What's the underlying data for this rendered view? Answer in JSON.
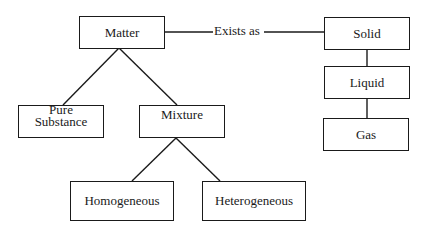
{
  "diagram": {
    "title": "",
    "nodes": {
      "matter": "Matter",
      "solid": "Solid",
      "liquid": "Liquid",
      "gas": "Gas",
      "pure_substance_line1": "Pure",
      "pure_substance_line2": "Substance",
      "mixture": "Mixture",
      "homogeneous": "Homogeneous",
      "heterogeneous": "Heterogeneous"
    },
    "edge_labels": {
      "matter_to_solid": "Exists as"
    },
    "edges": [
      {
        "from": "Matter",
        "to": "Solid",
        "label": "Exists as"
      },
      {
        "from": "Solid",
        "to": "Liquid"
      },
      {
        "from": "Liquid",
        "to": "Gas"
      },
      {
        "from": "Matter",
        "to": "Pure Substance"
      },
      {
        "from": "Matter",
        "to": "Mixture"
      },
      {
        "from": "Mixture",
        "to": "Homogeneous"
      },
      {
        "from": "Mixture",
        "to": "Heterogeneous"
      }
    ],
    "colors": {
      "stroke": "#1a1a1a",
      "background": "#ffffff"
    }
  }
}
